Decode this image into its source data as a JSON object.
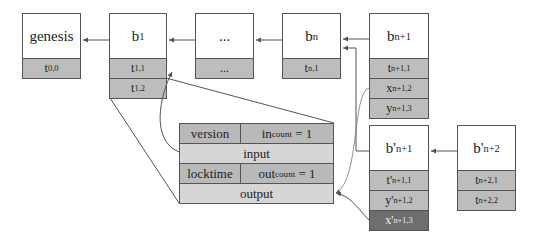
{
  "blocks": [
    {
      "id": "genesis",
      "label": "genesis",
      "txs": [
        {
          "base": "t",
          "sub": "0,0"
        }
      ]
    },
    {
      "id": "b1",
      "label": "b",
      "label_sub": "1",
      "txs": [
        {
          "base": "t",
          "sub": "1,1"
        },
        {
          "base": "t",
          "sub": "1,2"
        }
      ]
    },
    {
      "id": "ellipsis",
      "label": "...",
      "txs": [
        {
          "base": "...",
          "sub": ""
        }
      ]
    },
    {
      "id": "bn",
      "label": "b",
      "label_sub": "n",
      "txs": [
        {
          "base": "t",
          "sub": "n,1"
        }
      ]
    },
    {
      "id": "bn1",
      "label": "b",
      "label_sub": "n+1",
      "txs": [
        {
          "base": "t",
          "sub": "n+1,1"
        },
        {
          "base": "x",
          "sub": "n+1,2"
        },
        {
          "base": "y",
          "sub": "n+1,3"
        }
      ]
    },
    {
      "id": "bn1p",
      "label": "b'",
      "label_sub": "n+1",
      "txs": [
        {
          "base": "t'",
          "sub": "n+1,1"
        },
        {
          "base": "y'",
          "sub": "n+1,2"
        },
        {
          "base": "x'",
          "sub": "n+1,3",
          "dark": true
        }
      ]
    },
    {
      "id": "bn2p",
      "label": "b'",
      "label_sub": "n+2",
      "txs": [
        {
          "base": "t",
          "sub": "n+2,1"
        },
        {
          "base": "t",
          "sub": "n+2,2"
        }
      ]
    }
  ],
  "transaction": {
    "version": "version",
    "in_count_base": "in",
    "in_count_sub": "count",
    "in_count_val": " = 1",
    "input": "input",
    "locktime": "locktime",
    "out_count_base": "out",
    "out_count_sub": "count",
    "out_count_val": " = 1",
    "output": "output"
  },
  "colors": {
    "row": "#bdbdbd",
    "dark_row": "#6e6e6e",
    "tx_dark": "#b9b9b9",
    "tx_light": "#d6d6d6",
    "line": "#555555"
  }
}
